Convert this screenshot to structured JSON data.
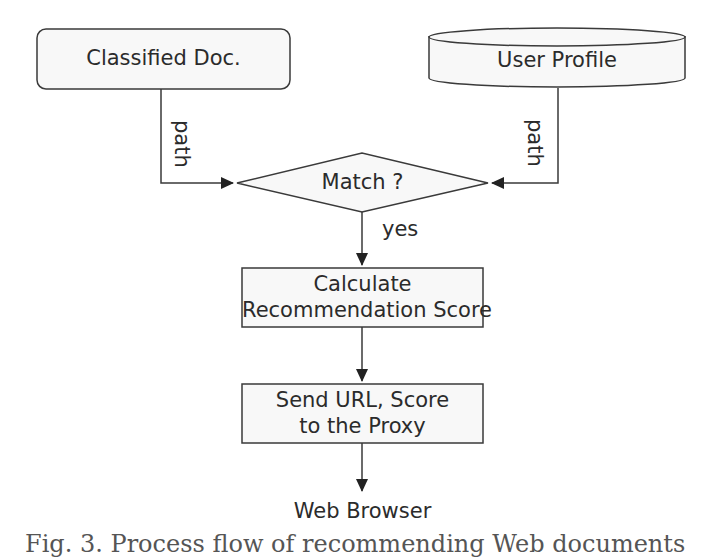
{
  "diagram": {
    "type": "flowchart",
    "nodes": {
      "classified_doc": {
        "label": "Classified Doc.",
        "shape": "rounded-rectangle"
      },
      "user_profile": {
        "label": "User Profile",
        "shape": "cylinder"
      },
      "match": {
        "label": "Match ?",
        "shape": "diamond"
      },
      "calculate": {
        "line1": "Calculate",
        "line2": "Recommendation Score",
        "shape": "rectangle"
      },
      "send": {
        "line1": "Send URL, Score",
        "line2": "to the Proxy",
        "shape": "rectangle"
      },
      "web_browser": {
        "label": "Web Browser",
        "shape": "text"
      }
    },
    "edges": [
      {
        "from": "classified_doc",
        "to": "match",
        "label": "path"
      },
      {
        "from": "user_profile",
        "to": "match",
        "label": "path"
      },
      {
        "from": "match",
        "to": "calculate",
        "label": "yes"
      },
      {
        "from": "calculate",
        "to": "send",
        "label": ""
      },
      {
        "from": "send",
        "to": "web_browser",
        "label": ""
      }
    ],
    "caption_partial": "Fig. 3. Process flow of recommending Web documents"
  },
  "colors": {
    "stroke": "#3a3a3a",
    "fill": "#f7f7f7",
    "text": "#2b2b2b"
  }
}
